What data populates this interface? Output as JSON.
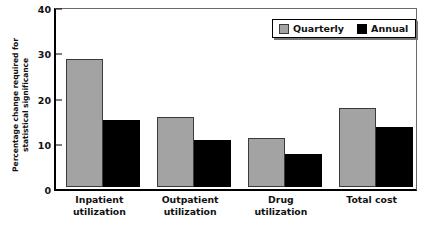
{
  "chart_data": {
    "type": "bar",
    "title": "",
    "xlabel": "",
    "ylabel": "Percentage change required for statistical significance",
    "ylabel_lines": [
      "Percentage change required for",
      "statistical significance"
    ],
    "categories": [
      "Inpatient utilization",
      "Outpatient utilization",
      "Drug utilization",
      "Total cost"
    ],
    "category_lines": [
      [
        "Inpatient",
        "utilization"
      ],
      [
        "Outpatient",
        "utilization"
      ],
      [
        "Drug",
        "utilization"
      ],
      [
        "Total cost"
      ]
    ],
    "series": [
      {
        "name": "Quarterly",
        "color": "#a3a3a3",
        "values": [
          28.3,
          15.5,
          10.8,
          17.4
        ]
      },
      {
        "name": "Annual",
        "color": "#000000",
        "values": [
          14.7,
          10.5,
          7.2,
          13.3
        ]
      }
    ],
    "ylim": [
      0,
      40
    ],
    "yticks": [
      0,
      10,
      20,
      30,
      40
    ],
    "ytick_labels": [
      "0",
      "10",
      "20",
      "30",
      "40"
    ],
    "grid": false,
    "legend_position": "top-right",
    "legend_entries": [
      "Quarterly",
      "Annual"
    ]
  }
}
